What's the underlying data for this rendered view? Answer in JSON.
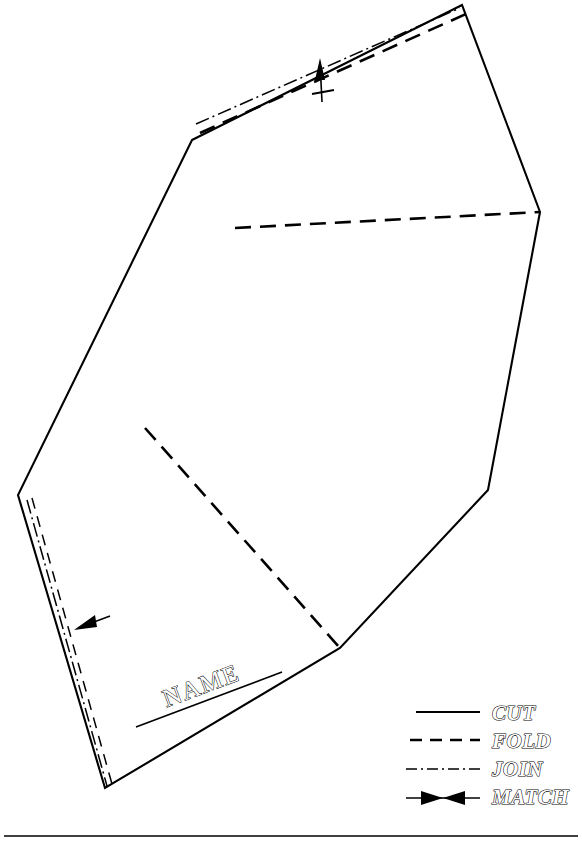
{
  "document": {
    "title": "Papercraft Fold Template",
    "name_field_label": "NAME"
  },
  "legend": {
    "title": "Line type legend",
    "items": [
      {
        "id": "cut",
        "label": "CUT",
        "style": "solid",
        "sample_icon": "solid-line-icon"
      },
      {
        "id": "fold",
        "label": "FOLD",
        "style": "dashed",
        "sample_icon": "dashed-line-icon"
      },
      {
        "id": "join",
        "label": "JOIN",
        "style": "dash-dot",
        "sample_icon": "dash-dot-line-icon"
      },
      {
        "id": "match",
        "label": "MATCH",
        "style": "double-arrow",
        "sample_icon": "match-arrow-icon"
      }
    ]
  },
  "colors": {
    "ink": "#000000",
    "paper": "#ffffff"
  },
  "geometry": {
    "cut_outline_points": "192,140 462,5 540,212 488,490 340,648 105,788 18,495",
    "fold_lines": [
      {
        "id": "fold-top-tab",
        "from": "202,131",
        "to": "466,14"
      },
      {
        "id": "fold-upper-panel",
        "from": "235,228",
        "to": "540,212"
      },
      {
        "id": "fold-mid-panel",
        "from": "145,428",
        "to": "340,648"
      }
    ],
    "join_lines": [
      {
        "id": "join-top-tab",
        "from": "196,126",
        "to": "462,10"
      },
      {
        "id": "join-left-tab",
        "from": "30,500",
        "to": "110,782"
      }
    ],
    "match_marks": [
      {
        "id": "match-top",
        "at": "322,88",
        "direction": "up"
      },
      {
        "id": "match-left",
        "at": "77,628",
        "direction": "left"
      }
    ],
    "name_rule": {
      "from": "136,727",
      "to": "282,672"
    },
    "footer_rule": {
      "from": "4,836",
      "to": "578,836"
    }
  }
}
